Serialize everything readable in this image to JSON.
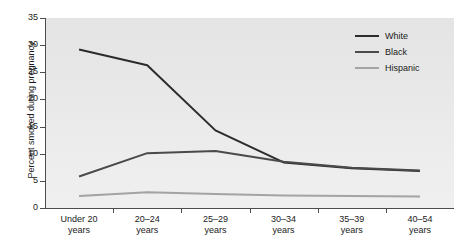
{
  "chart_data": {
    "type": "line",
    "title": "",
    "xlabel": "",
    "ylabel": "Percent smoked during pregnancy",
    "categories": [
      "Under 20 years",
      "20–24 years",
      "25–29 years",
      "30–34 years",
      "35–39 years",
      "40–54 years"
    ],
    "category_lines": [
      [
        "Under 20",
        "years"
      ],
      [
        "20–24",
        "years"
      ],
      [
        "25–29",
        "years"
      ],
      [
        "30–34",
        "years"
      ],
      [
        "35–39",
        "years"
      ],
      [
        "40–54",
        "years"
      ]
    ],
    "ylim": [
      0,
      35
    ],
    "yticks": [
      0,
      5,
      10,
      15,
      20,
      25,
      30,
      35
    ],
    "ytick_labels": [
      "0",
      "5",
      "10",
      "15",
      "20",
      "25",
      "30",
      "35"
    ],
    "grid": false,
    "legend_position": "top-right",
    "series": [
      {
        "name": "White",
        "color": "#2b2b2b",
        "values": [
          29.2,
          26.3,
          14.3,
          8.4,
          7.3,
          6.8
        ]
      },
      {
        "name": "Black",
        "color": "#4a4a4a",
        "values": [
          5.8,
          10.1,
          10.5,
          8.5,
          7.4,
          6.9
        ]
      },
      {
        "name": "Hispanic",
        "color": "#a3a3a3",
        "values": [
          2.2,
          2.9,
          2.6,
          2.3,
          2.2,
          2.1
        ]
      }
    ]
  },
  "legend": {
    "items": [
      {
        "label": "White",
        "color": "#2b2b2b"
      },
      {
        "label": "Black",
        "color": "#4a4a4a"
      },
      {
        "label": "Hispanic",
        "color": "#a3a3a3"
      }
    ]
  },
  "colors": {
    "plot_background": "#e7e7e7",
    "page_background": "#ffffff",
    "axis": "#4d4d4d",
    "text": "#1a1a1a"
  }
}
